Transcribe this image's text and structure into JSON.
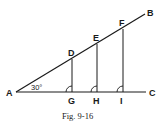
{
  "figure": {
    "caption": "Fig. 9-16",
    "angle_label": "30°",
    "points": {
      "A": "A",
      "B": "B",
      "C": "C",
      "D": "D",
      "E": "E",
      "F": "F",
      "G": "G",
      "H": "H",
      "I": "I"
    },
    "colors": {
      "line": "#1a1a1a",
      "background": "#ffffff"
    }
  }
}
